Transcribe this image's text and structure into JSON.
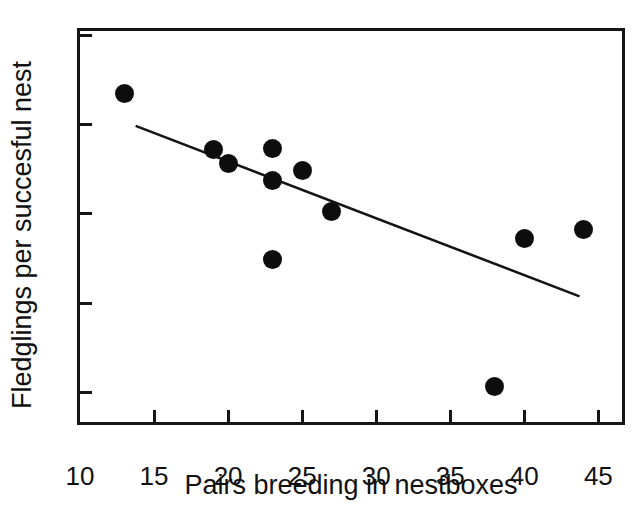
{
  "chart_data": {
    "type": "scatter",
    "title": "",
    "xlabel": "Pairs breeding in nestboxes",
    "ylabel": "Fledglings per succesful nest",
    "xlim": [
      10,
      47
    ],
    "ylim": [
      2.6,
      7.05
    ],
    "xticks": [
      10,
      15,
      20,
      25,
      30,
      35,
      40,
      45
    ],
    "yticks": [
      3,
      4,
      5,
      6,
      7
    ],
    "grid": false,
    "legend": null,
    "marker": {
      "shape": "circle",
      "color": "#0d0d0d",
      "size": 19
    },
    "points": [
      {
        "x": 13,
        "y": 6.35
      },
      {
        "x": 19,
        "y": 5.72
      },
      {
        "x": 20,
        "y": 5.56
      },
      {
        "x": 23,
        "y": 5.73
      },
      {
        "x": 23,
        "y": 5.37
      },
      {
        "x": 23,
        "y": 4.49
      },
      {
        "x": 25,
        "y": 5.49
      },
      {
        "x": 27,
        "y": 5.03
      },
      {
        "x": 38,
        "y": 3.07
      },
      {
        "x": 40,
        "y": 4.72
      },
      {
        "x": 44,
        "y": 4.83
      }
    ],
    "trendline": {
      "type": "line",
      "color": "#151515",
      "x_start": 13.8,
      "y_start": 5.97,
      "x_end": 44.1,
      "y_end": 4.03
    }
  },
  "axis": {
    "x_tick_labels": [
      "10",
      "15",
      "20",
      "25",
      "30",
      "35",
      "40",
      "45"
    ],
    "y_tick_labels": [
      "3",
      "4",
      "5",
      "6",
      "7"
    ],
    "x_title": "Pairs breeding in nestboxes",
    "y_title": "Fledglings per succesful nest"
  },
  "colors": {
    "axis": "#151515",
    "marker": "#0d0d0d",
    "trend": "#151515",
    "background": "#ffffff",
    "text": "#111111"
  }
}
